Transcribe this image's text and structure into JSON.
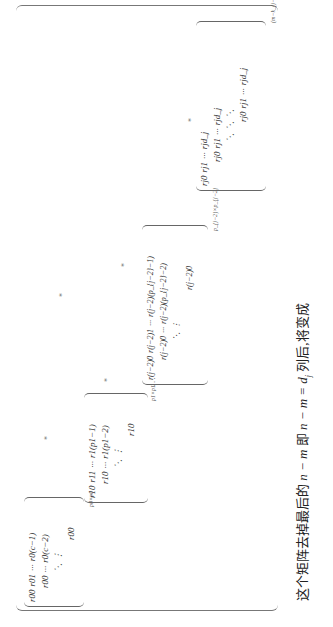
{
  "matrix": {
    "outer_subscript": "(m−k_{j−1})×(n−k_{j−1})",
    "blocks": [
      {
        "name": "block-0",
        "rows": [
          [
            "r00",
            "r01",
            "···",
            "r0(c−1)"
          ],
          [
            "r00",
            "···",
            "r0(c−2)"
          ],
          [
            "⋱",
            "⋮"
          ],
          [
            "r00"
          ]
        ],
        "subscript": "p0×p0"
      },
      {
        "name": "block-1",
        "rows": [
          [
            "r10",
            "r11",
            "···",
            "r1(p1−1)"
          ],
          [
            "r10",
            "···",
            "r1(p1−2)"
          ],
          [
            "⋱",
            "⋮"
          ],
          [
            "r10"
          ]
        ],
        "subscript": "p1×p1"
      },
      {
        "name": "block-j-2",
        "rows": [
          [
            "r(j−2)0",
            "r(j−2)1",
            "···",
            "r(j−2)(p_{j−2}−1)"
          ],
          [
            "r(j−2)0",
            "···",
            "r(j−2)(p_{j−2}−2)"
          ],
          [
            "⋱",
            "⋮"
          ],
          [
            "r(j−2)0"
          ]
        ],
        "subscript": "p_{j−2}×p_{j−2}"
      },
      {
        "name": "block-j",
        "rows": [
          [
            "rj0",
            "rj1",
            "···",
            "rjd_j"
          ],
          [
            "rj0",
            "rj1",
            "···",
            "rjd_j"
          ],
          [
            "⋱",
            "⋱",
            "⋱"
          ],
          [
            "rj0",
            "rj1",
            "···",
            "rjd_j"
          ]
        ],
        "subscript": ""
      }
    ],
    "star": "*",
    "between_dots": "···"
  },
  "caption": {
    "part1": "这个矩阵去掉最后的 ",
    "m1": "n − m",
    "part2": " 即 ",
    "m2": "n − m = d",
    "m2sub": "j",
    "part3": " 列后,将变成"
  }
}
